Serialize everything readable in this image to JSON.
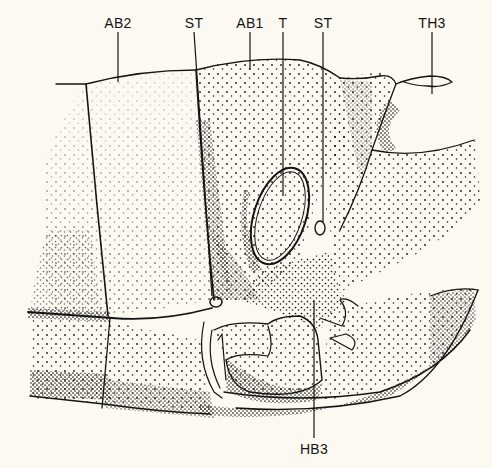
{
  "figure": {
    "background_color": "#fbf9f1",
    "ink_color": "#141414",
    "labels": [
      {
        "id": "ab2",
        "text": "AB2",
        "x": 118,
        "y": 22,
        "line_to": [
          118,
          82
        ]
      },
      {
        "id": "st-left",
        "text": "ST",
        "x": 194,
        "y": 22,
        "line_to": [
          194,
          302
        ]
      },
      {
        "id": "ab1",
        "text": "AB1",
        "x": 250,
        "y": 22,
        "line_to": [
          250,
          72
        ]
      },
      {
        "id": "t",
        "text": "T",
        "x": 283,
        "y": 22,
        "line_to": [
          283,
          196
        ]
      },
      {
        "id": "st-right",
        "text": "ST",
        "x": 323,
        "y": 22,
        "line_to": [
          323,
          222
        ]
      },
      {
        "id": "th3",
        "text": "TH3",
        "x": 432,
        "y": 22,
        "line_to": [
          432,
          94
        ]
      },
      {
        "id": "hb3",
        "text": "HB3",
        "x": 314,
        "y": 452,
        "line_to": [
          314,
          300
        ]
      }
    ]
  }
}
